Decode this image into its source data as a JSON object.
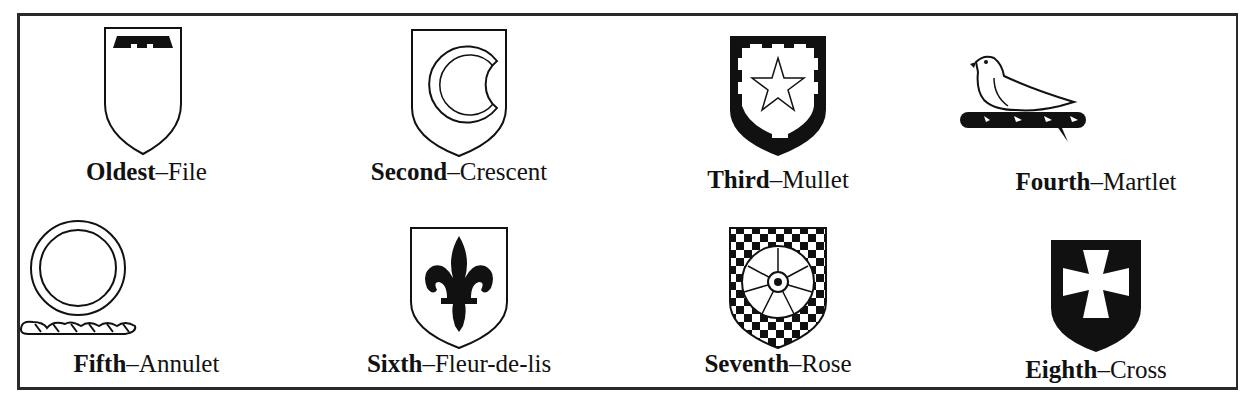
{
  "rows": [
    [
      {
        "rank": "Oldest",
        "sep": "–",
        "charge": "File",
        "icon": "file-label-icon"
      },
      {
        "rank": "Second",
        "sep": "–",
        "charge": "Crescent",
        "icon": "crescent-icon"
      },
      {
        "rank": "Third",
        "sep": "–",
        "charge": "Mullet",
        "icon": "mullet-star-icon"
      },
      {
        "rank": "Fourth",
        "sep": "–",
        "charge": "Martlet",
        "icon": "martlet-bird-icon"
      }
    ],
    [
      {
        "rank": "Fifth",
        "sep": "–",
        "charge": "Annulet",
        "icon": "annulet-ring-icon"
      },
      {
        "rank": "Sixth",
        "sep": "–",
        "charge": "Fleur-de-lis",
        "icon": "fleur-de-lis-icon"
      },
      {
        "rank": "Seventh",
        "sep": "–",
        "charge": "Rose",
        "icon": "rose-icon"
      },
      {
        "rank": "Eighth",
        "sep": "–",
        "charge": "Cross",
        "icon": "cross-moline-icon"
      }
    ]
  ],
  "colors": {
    "ink": "#111111",
    "paper": "#ffffff",
    "border": "#2a2a2a"
  }
}
